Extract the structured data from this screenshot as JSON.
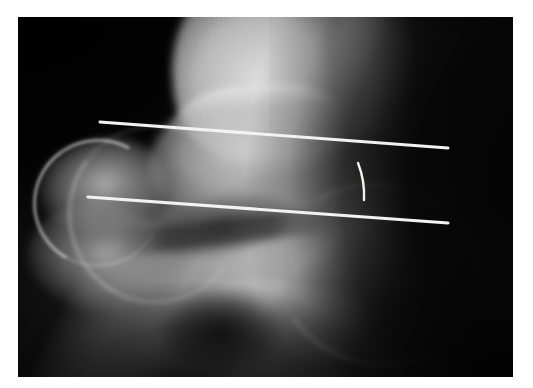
{
  "image": {
    "kind": "radiograph",
    "modality": "X-ray",
    "view": "lateral foot / ankle",
    "caption": "",
    "plate": {
      "x": 18,
      "y": 17,
      "width": 495,
      "height": 360
    },
    "border_color": "#ffffff",
    "background_color": "#0a0a0a"
  },
  "annotations": {
    "overlay_color": "#f2f2ee",
    "vertex": {
      "x": 285,
      "y": 175
    },
    "lines": [
      {
        "name": "upper-measurement-line",
        "x1": 100,
        "y1": 122,
        "x2": 448,
        "y2": 148
      },
      {
        "name": "lower-measurement-line",
        "x1": 88,
        "y1": 197,
        "x2": 448,
        "y2": 223
      }
    ],
    "arc": {
      "name": "angle-arc",
      "x1": 358,
      "y1": 163,
      "x2": 364,
      "y2": 200,
      "radius": 88,
      "bulge": "right"
    }
  },
  "anatomy": {
    "structures": [
      {
        "name": "tibia",
        "label": "tibia"
      },
      {
        "name": "fibula",
        "label": "fibula"
      },
      {
        "name": "talus",
        "label": "talus"
      },
      {
        "name": "calcaneus",
        "label": "calcaneus"
      },
      {
        "name": "navicular",
        "label": "navicular"
      },
      {
        "name": "cuboid",
        "label": "cuboid"
      },
      {
        "name": "sinus-tarsi",
        "label": "sinus tarsi"
      }
    ]
  }
}
